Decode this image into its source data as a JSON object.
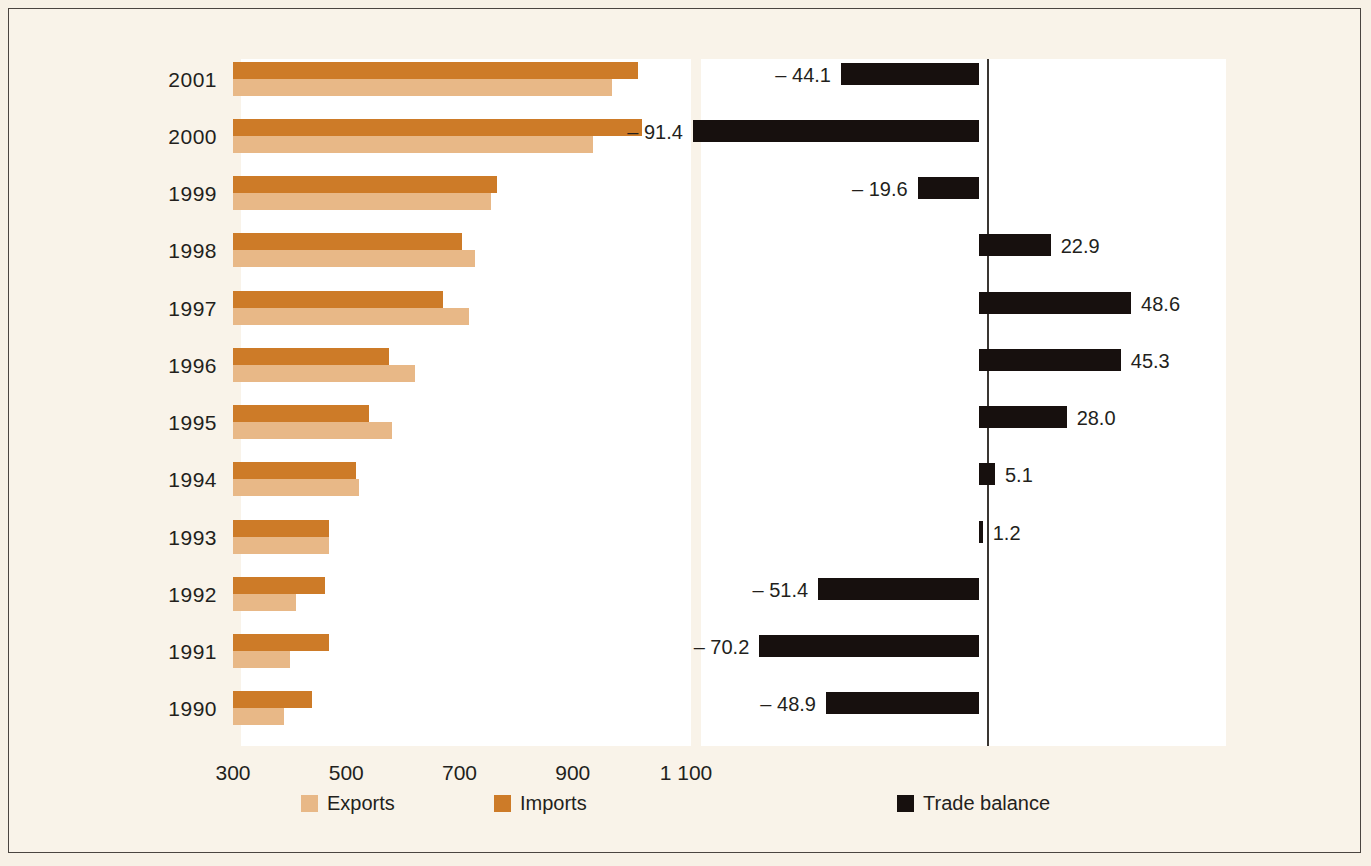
{
  "chart_data": {
    "type": "bar",
    "title": "",
    "subtitle": "",
    "xlabel": "",
    "ylabel": "",
    "orientation": "horizontal",
    "grid": false,
    "legend_position": "bottom",
    "categories": [
      "2001",
      "2000",
      "1999",
      "1998",
      "1997",
      "1996",
      "1995",
      "1994",
      "1993",
      "1992",
      "1991",
      "1990"
    ],
    "axis_left": {
      "ticks": [
        "300",
        "500",
        "700",
        "900",
        "1 100"
      ],
      "tick_values": [
        300,
        500,
        700,
        900,
        1100
      ],
      "xlim": [
        300,
        1100
      ]
    },
    "axis_right": {
      "zero_line": 0,
      "xlim": [
        -100,
        70
      ]
    },
    "series": [
      {
        "name": "Exports",
        "color": "#e8b887",
        "values": [
          970,
          935,
          755,
          727,
          716,
          622,
          581,
          522,
          470,
          412,
          401,
          390
        ]
      },
      {
        "name": "Imports",
        "color": "#cd7b28",
        "values": [
          1015,
          1022,
          766,
          705,
          670,
          576,
          540,
          517,
          469,
          462,
          469,
          439
        ]
      },
      {
        "name": "Trade balance",
        "color": "#17100e",
        "values": [
          -44.1,
          -91.4,
          -19.6,
          22.9,
          48.6,
          45.3,
          28.0,
          5.1,
          1.2,
          -51.4,
          -70.2,
          -48.9
        ],
        "labels": [
          "– 44.1",
          "– 91.4",
          "– 19.6",
          "22.9",
          "48.6",
          "45.3",
          "28.0",
          "5.1",
          "1.2",
          "– 51.4",
          "– 70.2",
          "– 48.9"
        ]
      }
    ]
  },
  "rows": [
    {
      "year": "2001",
      "exports": 970,
      "imports": 1015,
      "balance": -44.1,
      "balance_label": "– 44.1"
    },
    {
      "year": "2000",
      "exports": 935,
      "imports": 1022,
      "balance": -91.4,
      "balance_label": "– 91.4"
    },
    {
      "year": "1999",
      "exports": 755,
      "imports": 766,
      "balance": -19.6,
      "balance_label": "– 19.6"
    },
    {
      "year": "1998",
      "exports": 727,
      "imports": 705,
      "balance": 22.9,
      "balance_label": "22.9"
    },
    {
      "year": "1997",
      "exports": 716,
      "imports": 670,
      "balance": 48.6,
      "balance_label": "48.6"
    },
    {
      "year": "1996",
      "exports": 622,
      "imports": 576,
      "balance": 45.3,
      "balance_label": "45.3"
    },
    {
      "year": "1995",
      "exports": 581,
      "imports": 540,
      "balance": 28.0,
      "balance_label": "28.0"
    },
    {
      "year": "1994",
      "exports": 522,
      "imports": 517,
      "balance": 5.1,
      "balance_label": "5.1"
    },
    {
      "year": "1993",
      "exports": 470,
      "imports": 469,
      "balance": 1.2,
      "balance_label": "1.2"
    },
    {
      "year": "1992",
      "exports": 412,
      "imports": 462,
      "balance": -51.4,
      "balance_label": "– 51.4"
    },
    {
      "year": "1991",
      "exports": 401,
      "imports": 469,
      "balance": -70.2,
      "balance_label": "– 70.2"
    },
    {
      "year": "1990",
      "exports": 390,
      "imports": 439,
      "balance": -48.9,
      "balance_label": "– 48.9"
    }
  ],
  "x_ticks": [
    "300",
    "500",
    "700",
    "900",
    "1 100"
  ],
  "legend": [
    {
      "label": "Exports",
      "color": "#e8b887"
    },
    {
      "label": "Imports",
      "color": "#cd7b28"
    },
    {
      "label": "Trade balance",
      "color": "#17100e"
    }
  ],
  "colors": {
    "exports": "#e8b887",
    "imports": "#cd7b28",
    "balance": "#17100e",
    "background": "#f7f1e6",
    "panel": "#ffffff",
    "border": "#4a4540",
    "text": "#231f1c"
  }
}
